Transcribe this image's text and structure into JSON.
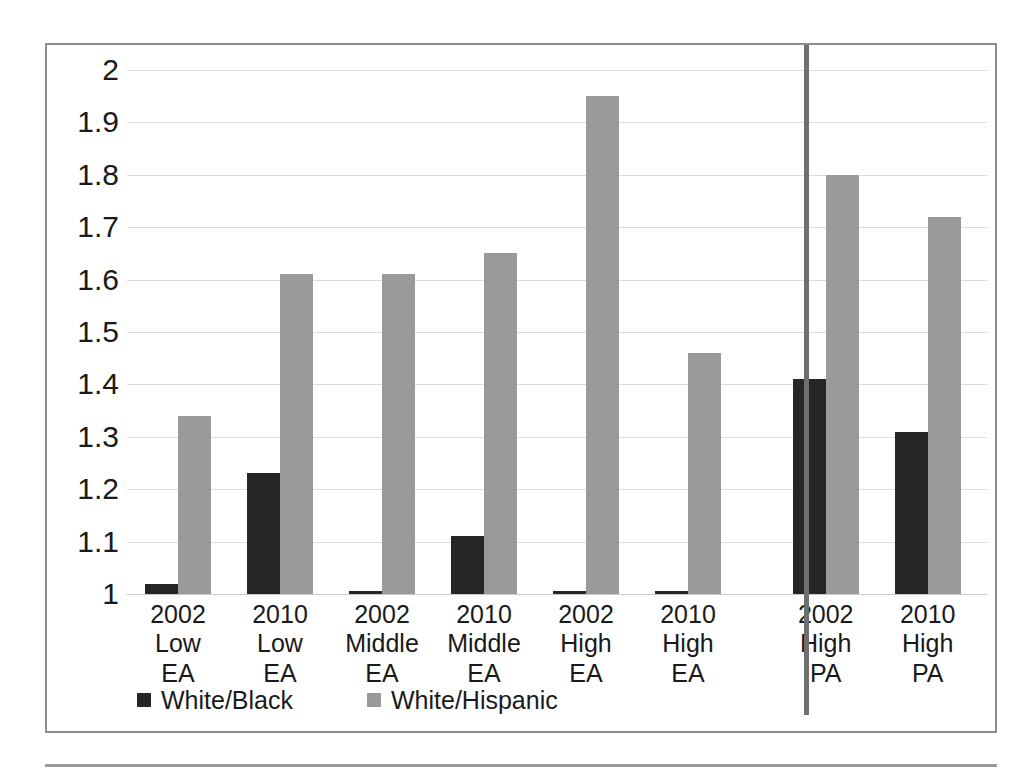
{
  "chart_data": {
    "type": "bar",
    "title": "",
    "subtitle": "",
    "xlabel": "",
    "ylabel": "",
    "ylim": [
      1,
      2
    ],
    "ytick_step": 0.1,
    "grid": true,
    "legend_position": "bottom-left",
    "categories": [
      "2002 Low EA",
      "2010 Low EA",
      "2002 Middle EA",
      "2010 Middle EA",
      "2002 High EA",
      "2010 High EA",
      "2002 High PA",
      "2010 High PA"
    ],
    "category_lines": [
      [
        "2002 Low",
        "EA"
      ],
      [
        "2010 Low",
        "EA"
      ],
      [
        "2002",
        "Middle EA"
      ],
      [
        "2010",
        "Middle EA"
      ],
      [
        "2002 High",
        "EA"
      ],
      [
        "2010 High",
        "EA"
      ],
      [
        "2002 High",
        "PA"
      ],
      [
        "2010 High",
        "PA"
      ]
    ],
    "series": [
      {
        "name": "White/Black",
        "color": "#262626",
        "values": [
          1.02,
          1.23,
          1.005,
          1.11,
          1.005,
          1.005,
          1.41,
          1.31
        ]
      },
      {
        "name": "White/Hispanic",
        "color": "#9a9a9a",
        "values": [
          1.34,
          1.61,
          1.61,
          1.65,
          1.95,
          1.46,
          1.8,
          1.72
        ]
      }
    ],
    "ytick_labels": [
      "2",
      "1.9",
      "1.8",
      "1.7",
      "1.6",
      "1.5",
      "1.4",
      "1.3",
      "1.2",
      "1.1",
      "1"
    ],
    "ytick_values": [
      2,
      1.9,
      1.8,
      1.7,
      1.6,
      1.5,
      1.4,
      1.3,
      1.2,
      1.1,
      1
    ],
    "annotations": {
      "separator": "vertical divider between EA groups and PA groups"
    }
  },
  "legend": {
    "items": [
      {
        "label": "White/Black",
        "color": "#262626"
      },
      {
        "label": "White/Hispanic",
        "color": "#9a9a9a"
      }
    ]
  },
  "colors": {
    "black_series": "#262626",
    "gray_series": "#9a9a9a",
    "frame": "#8d8d8d",
    "gridline": "#dcdcdc",
    "separator": "#6f6f6f",
    "text": "#1a1a1a"
  }
}
